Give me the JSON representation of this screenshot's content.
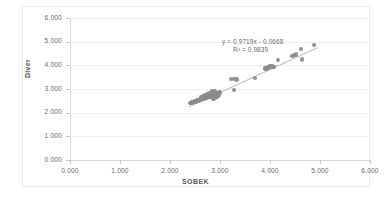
{
  "chart_data": {
    "type": "scatter",
    "title": "",
    "xlabel": "SOBEK",
    "ylabel": "Diver",
    "xlim": [
      0,
      6
    ],
    "ylim": [
      0,
      6
    ],
    "xticks": [
      "0.000",
      "1.000",
      "2.000",
      "3.000",
      "4.000",
      "5.000",
      "6.000"
    ],
    "yticks": [
      "0.000",
      "1.000",
      "2.000",
      "3.000",
      "4.000",
      "5.000",
      "6.000"
    ],
    "xtick_values": [
      0,
      1,
      2,
      3,
      4,
      5,
      6
    ],
    "ytick_values": [
      0,
      1,
      2,
      3,
      4,
      5,
      6
    ],
    "grid": "horizontal",
    "legend": "none",
    "marker_color": "#8a8a8e",
    "trendline_color": "#9a9a9e",
    "annotations": [
      "y = 0.9719x - 0.0668",
      "R² = 0.9839"
    ],
    "equation": "y = 0.9719x - 0.0668",
    "r_squared_label": "R² = 0.9839",
    "slope": 0.9719,
    "intercept": -0.0668,
    "r_squared": 0.9839,
    "trendline_domain": [
      2.38,
      4.95
    ],
    "points": [
      [
        2.4,
        2.4
      ],
      [
        2.42,
        2.41
      ],
      [
        2.44,
        2.43
      ],
      [
        2.45,
        2.44
      ],
      [
        2.47,
        2.45
      ],
      [
        2.48,
        2.46
      ],
      [
        2.5,
        2.47
      ],
      [
        2.51,
        2.48
      ],
      [
        2.53,
        2.49
      ],
      [
        2.54,
        2.5
      ],
      [
        2.55,
        2.51
      ],
      [
        2.57,
        2.52
      ],
      [
        2.58,
        2.53
      ],
      [
        2.6,
        2.54
      ],
      [
        2.61,
        2.55
      ],
      [
        2.62,
        2.56
      ],
      [
        2.64,
        2.57
      ],
      [
        2.65,
        2.58
      ],
      [
        2.67,
        2.59
      ],
      [
        2.68,
        2.6
      ],
      [
        2.69,
        2.61
      ],
      [
        2.71,
        2.62
      ],
      [
        2.72,
        2.63
      ],
      [
        2.74,
        2.64
      ],
      [
        2.75,
        2.65
      ],
      [
        2.76,
        2.66
      ],
      [
        2.78,
        2.67
      ],
      [
        2.79,
        2.68
      ],
      [
        2.81,
        2.69
      ],
      [
        2.82,
        2.7
      ],
      [
        2.83,
        2.71
      ],
      [
        2.85,
        2.72
      ],
      [
        2.86,
        2.58
      ],
      [
        2.88,
        2.6
      ],
      [
        2.89,
        2.62
      ],
      [
        2.9,
        2.64
      ],
      [
        2.92,
        2.66
      ],
      [
        2.93,
        2.68
      ],
      [
        2.95,
        2.7
      ],
      [
        2.96,
        2.72
      ],
      [
        2.88,
        2.78
      ],
      [
        2.91,
        2.8
      ],
      [
        2.94,
        2.82
      ],
      [
        2.97,
        2.84
      ],
      [
        2.99,
        2.86
      ],
      [
        2.86,
        2.88
      ],
      [
        2.84,
        2.9
      ],
      [
        2.9,
        2.92
      ],
      [
        2.95,
        2.74
      ],
      [
        2.98,
        2.76
      ],
      [
        2.62,
        2.66
      ],
      [
        2.66,
        2.7
      ],
      [
        2.7,
        2.74
      ],
      [
        2.74,
        2.78
      ],
      [
        2.78,
        2.82
      ],
      [
        3.22,
        3.41
      ],
      [
        3.28,
        3.42
      ],
      [
        3.33,
        3.4
      ],
      [
        3.28,
        2.96
      ],
      [
        3.7,
        3.47
      ],
      [
        3.92,
        3.88
      ],
      [
        3.95,
        3.9
      ],
      [
        3.97,
        3.92
      ],
      [
        3.99,
        3.93
      ],
      [
        4.01,
        3.95
      ],
      [
        4.03,
        3.96
      ],
      [
        4.05,
        3.94
      ],
      [
        4.07,
        3.92
      ],
      [
        3.9,
        3.86
      ],
      [
        3.93,
        3.84
      ],
      [
        4.16,
        4.22
      ],
      [
        4.45,
        4.4
      ],
      [
        4.48,
        4.43
      ],
      [
        4.52,
        4.45
      ],
      [
        4.62,
        4.7
      ],
      [
        4.64,
        4.25
      ],
      [
        4.88,
        4.87
      ]
    ]
  },
  "axes": {
    "y_title": "Diver",
    "x_title": "SOBEK"
  }
}
